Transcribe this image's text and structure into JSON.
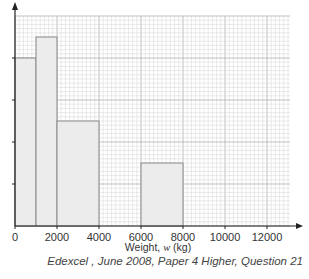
{
  "chart_data": {
    "type": "bar",
    "subtype": "histogram",
    "title": "",
    "xlabel": "Weight, w (kg)",
    "ylabel": "",
    "bins": [
      {
        "from": 0,
        "to": 1000,
        "height": 4
      },
      {
        "from": 1000,
        "to": 2000,
        "height": 4.5
      },
      {
        "from": 2000,
        "to": 4000,
        "height": 2.5
      },
      {
        "from": 6000,
        "to": 8000,
        "height": 1.5
      }
    ],
    "x_ticks": [
      0,
      2000,
      4000,
      6000,
      8000,
      10000,
      12000
    ],
    "x_tick_labels": [
      "0",
      "2000",
      "4000",
      "6000",
      "8000",
      "10000",
      "12000"
    ],
    "y_ticks_unlabeled": [
      1,
      2,
      3,
      4
    ],
    "xlim": [
      0,
      13000
    ],
    "ylim": [
      0,
      5
    ],
    "grid": true,
    "legend": null,
    "colors": {
      "bar_fill": "#ececec",
      "bar_edge": "#888888",
      "grid_minor": "#d4d4d4",
      "grid_major": "#b0b0b0",
      "axis": "#222222"
    }
  },
  "caption": "Edexcel , June 2008, Paper 4 Higher, Question 21"
}
